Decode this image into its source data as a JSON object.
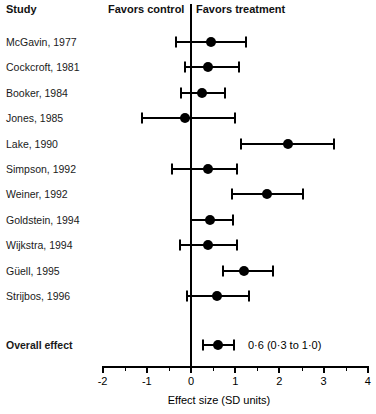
{
  "header": {
    "study_label": "Study",
    "favors_control": "Favors control",
    "favors_treatment": "Favors treatment"
  },
  "axis": {
    "title": "Effect size (SD units)",
    "ticks": [
      "-2",
      "-1",
      "0",
      "1",
      "2",
      "3",
      "4"
    ],
    "min": -2,
    "max": 4,
    "null_value": 0
  },
  "overall_annotation": "0·0 (0·3 to 1·0)",
  "chart_data": {
    "type": "forest",
    "title": "",
    "xlabel": "Effect size (SD units)",
    "ylabel": "",
    "xlim": [
      -2,
      4
    ],
    "grid": false,
    "null_line": 0,
    "legend": [
      "Favors control",
      "Favors treatment"
    ],
    "columns": [
      "Study",
      "Effect size",
      "Lower CI",
      "Upper CI"
    ],
    "rows": [
      {
        "study": "McGavin, 1977",
        "effect": 0.45,
        "low": -0.33,
        "high": 1.25
      },
      {
        "study": "Cockcroft, 1981",
        "effect": 0.38,
        "low": -0.14,
        "high": 1.08
      },
      {
        "study": "Booker, 1984",
        "effect": 0.25,
        "low": -0.23,
        "high": 0.76
      },
      {
        "study": "Jones, 1985",
        "effect": -0.13,
        "low": -1.1,
        "high": 0.99
      },
      {
        "study": "Lake, 1990",
        "effect": 2.2,
        "low": 1.13,
        "high": 3.24
      },
      {
        "study": "Simpson, 1992",
        "effect": 0.38,
        "low": -0.42,
        "high": 1.03
      },
      {
        "study": "Weiner, 1992",
        "effect": 1.72,
        "low": 0.92,
        "high": 2.54
      },
      {
        "study": "Goldstein, 1994",
        "effect": 0.42,
        "low": 0.01,
        "high": 0.95
      },
      {
        "study": "Wijkstra, 1994",
        "effect": 0.38,
        "low": -0.24,
        "high": 1.04
      },
      {
        "study": "Güell, 1995",
        "effect": 1.2,
        "low": 0.72,
        "high": 1.86
      },
      {
        "study": "Strijbos, 1996",
        "effect": 0.58,
        "low": -0.08,
        "high": 1.31
      },
      {
        "study": "Overall effect",
        "effect": 0.6,
        "low": 0.27,
        "high": 0.98,
        "annotation": "0·6 (0·3 to 1·0)",
        "bold": true
      }
    ]
  }
}
